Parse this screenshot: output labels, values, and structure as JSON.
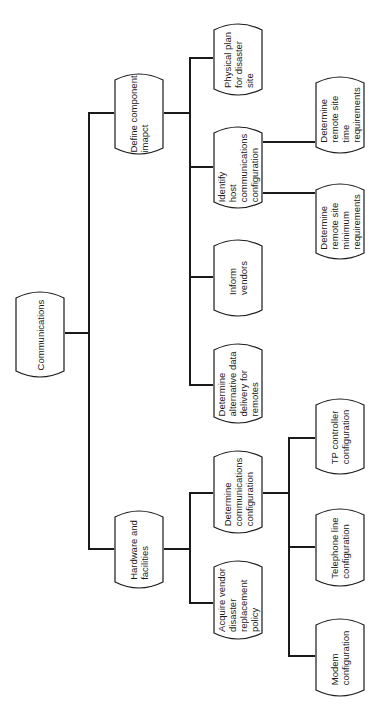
{
  "diagram": {
    "type": "hierarchy-tree",
    "orientation": "rotated-90-ccw",
    "root": {
      "label": "Communications",
      "children": [
        {
          "label": "Define component\nimapct",
          "children": [
            {
              "label": "Physical plan\nfor disaster\nsite"
            },
            {
              "label": "Identify\nhost\ncommunications\nconfiguration",
              "children": [
                {
                  "label": "Determine\nremote site\ntime\nrequirements"
                },
                {
                  "label": "Determine\nremote site\nminimum\nrequirements"
                }
              ]
            },
            {
              "label": "Inform\nvendors"
            },
            {
              "label": "Determine\nalternative data\ndelivery for\nremotes"
            }
          ]
        },
        {
          "label": "Hardware and\nfacilities",
          "children": [
            {
              "label": "Determine\ncommunications\nconfiguration",
              "children": [
                {
                  "label": "TP controller\nconfiguration"
                },
                {
                  "label": "Telephone line\nconfiguration"
                },
                {
                  "label": "Modem\nconfiguration"
                }
              ]
            },
            {
              "label": "Acquire vendor\ndisaster\nreplacement\npolicy"
            }
          ]
        }
      ]
    }
  },
  "nodes": {
    "communications": "Communications",
    "define_component": "Define component\nimapct",
    "hardware": "Hardware and\nfacilities",
    "physical_plan": "Physical plan\nfor disaster\nsite",
    "identify_host": "Identify\nhost\ncommunications\nconfiguration",
    "inform_vendors": "Inform\nvendors",
    "alt_data": "Determine\nalternative data\ndelivery for\nremotes",
    "remote_time": "Determine\nremote site\ntime\nrequirements",
    "remote_minimum": "Determine\nremote site\nminimum\nrequirements",
    "comms_config": "Determine\ncommunications\nconfiguration",
    "acquire_vendor": "Acquire vendor\ndisaster\nreplacement\npolicy",
    "tp_controller": "TP controller\nconfiguration",
    "telephone_line": "Telephone line\nconfiguration",
    "modem": "Modem\nconfiguration"
  },
  "colors": {
    "line": "#1a1a1a",
    "background": "#ffffff"
  }
}
